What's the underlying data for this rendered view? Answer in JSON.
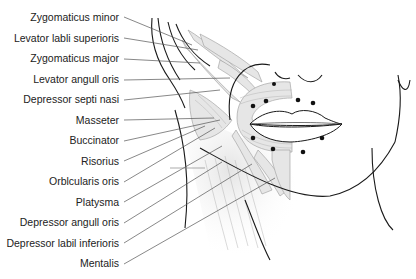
{
  "figure": {
    "labels": [
      {
        "id": "zygomaticus-minor",
        "text": "Zygomaticus minor",
        "y": 17
      },
      {
        "id": "levator-labii-superioris",
        "text": "Levator labli superioris",
        "y": 38
      },
      {
        "id": "zygomaticus-major",
        "text": "Zygomaticus major",
        "y": 58
      },
      {
        "id": "levator-anguli-oris",
        "text": "Levator angull oris",
        "y": 79
      },
      {
        "id": "depressor-septi-nasi",
        "text": "Depressor septi nasi",
        "y": 99
      },
      {
        "id": "masseter",
        "text": "Masseter",
        "y": 120
      },
      {
        "id": "buccinator",
        "text": "Buccinator",
        "y": 140
      },
      {
        "id": "risorius",
        "text": "Risorius",
        "y": 161
      },
      {
        "id": "orbicularis-oris",
        "text": "Orblcularis oris",
        "y": 181
      },
      {
        "id": "platysma",
        "text": "Platysma",
        "y": 202
      },
      {
        "id": "depressor-anguli-oris",
        "text": "Depressor angull oris",
        "y": 222
      },
      {
        "id": "depressor-labii-inferioris",
        "text": "Depressor labil inferioris",
        "y": 243
      },
      {
        "id": "mentalis",
        "text": "Mentalis",
        "y": 263
      }
    ],
    "colors": {
      "text": "#222222",
      "outline": "#1a1a1a",
      "leader": "#555555",
      "muscle_fill": "#e6e6e6",
      "muscle_stroke": "#9a9a9a",
      "dot": "#111111"
    }
  }
}
